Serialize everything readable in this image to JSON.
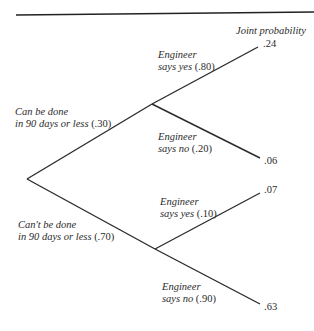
{
  "diagram": {
    "type": "decision-tree",
    "column_header": "Joint probability",
    "root": {
      "branches": [
        {
          "label_line1": "Can be done",
          "label_line2": "in 90 days or less",
          "prob": "(.30)",
          "children": [
            {
              "label_line1": "Engineer",
              "label_line2": "says yes",
              "prob": "(.80)",
              "joint": ".24"
            },
            {
              "label_line1": "Engineer",
              "label_line2": "says no",
              "prob": "(.20)",
              "joint": ".06"
            }
          ]
        },
        {
          "label_line1": "Can't be done",
          "label_line2": "in 90 days or less",
          "prob": "(.70)",
          "children": [
            {
              "label_line1": "Engineer",
              "label_line2": "says yes",
              "prob": "(.10)",
              "joint": ".07"
            },
            {
              "label_line1": "Engineer",
              "label_line2": "says no",
              "prob": "(.90)",
              "joint": ".63"
            }
          ]
        }
      ]
    },
    "colors": {
      "line": "#2b2b2b",
      "text": "#2b2b2b",
      "background": "#ffffff"
    }
  }
}
